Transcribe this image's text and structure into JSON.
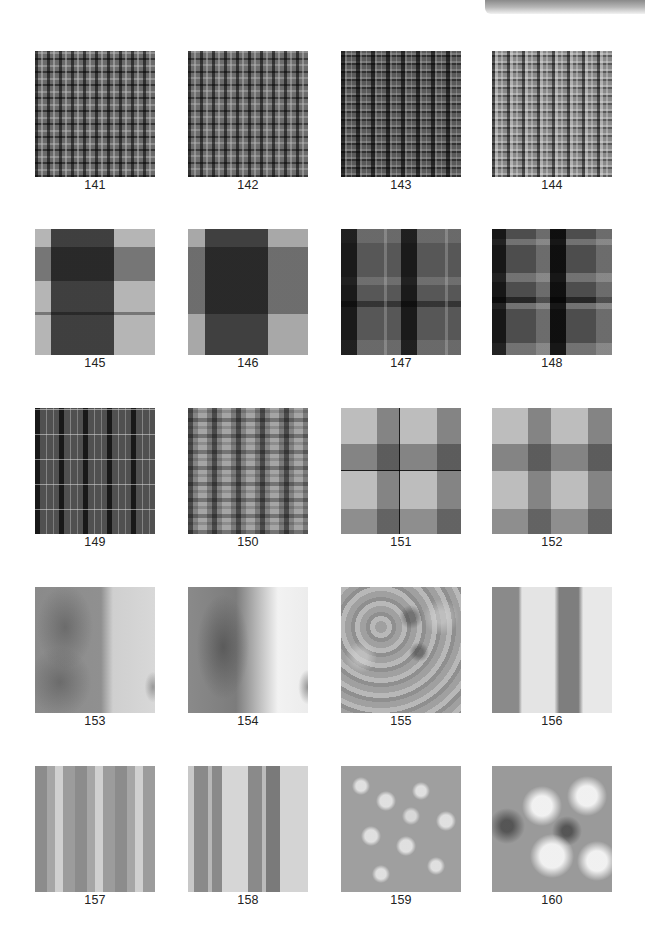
{
  "page": {
    "corner_tab_color": "#8a8a8a",
    "background": "#ffffff"
  },
  "tiles": [
    {
      "id": "141",
      "label": "141",
      "texture": "plaid-fine-dark"
    },
    {
      "id": "142",
      "label": "142",
      "texture": "plaid-fine-dark"
    },
    {
      "id": "143",
      "label": "143",
      "texture": "plaid-fine-dense-dark"
    },
    {
      "id": "144",
      "label": "144",
      "texture": "plaid-fine-dense-light"
    },
    {
      "id": "145",
      "label": "145",
      "texture": "plaid-large-block"
    },
    {
      "id": "146",
      "label": "146",
      "texture": "plaid-large-block"
    },
    {
      "id": "147",
      "label": "147",
      "texture": "plaid-medium-dark"
    },
    {
      "id": "148",
      "label": "148",
      "texture": "plaid-medium-dark-contrast"
    },
    {
      "id": "149",
      "label": "149",
      "texture": "plaid-pinstripe-dark"
    },
    {
      "id": "150",
      "label": "150",
      "texture": "plaid-stripe-light"
    },
    {
      "id": "151",
      "label": "151",
      "texture": "plaid-block-light-with-line"
    },
    {
      "id": "152",
      "label": "152",
      "texture": "plaid-block-light"
    },
    {
      "id": "153",
      "label": "153",
      "texture": "noise-wave-soft"
    },
    {
      "id": "154",
      "label": "154",
      "texture": "noise-wave-strong"
    },
    {
      "id": "155",
      "label": "155",
      "texture": "cellular-mottled"
    },
    {
      "id": "156",
      "label": "156",
      "texture": "cellular-marbled"
    },
    {
      "id": "157",
      "label": "157",
      "texture": "noise-vertical-stripes"
    },
    {
      "id": "158",
      "label": "158",
      "texture": "noise-vertical-stripes-contrast"
    },
    {
      "id": "159",
      "label": "159",
      "texture": "bubbles-soft"
    },
    {
      "id": "160",
      "label": "160",
      "texture": "bubbles-contrast"
    }
  ]
}
